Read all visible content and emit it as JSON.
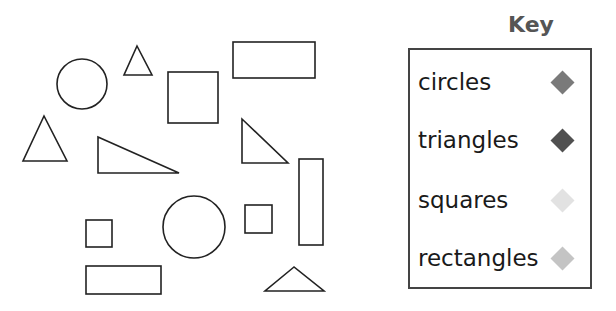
{
  "key": {
    "title": "Key",
    "items": [
      {
        "label": "circles",
        "color": "#7a7a7a"
      },
      {
        "label": "triangles",
        "color": "#505050"
      },
      {
        "label": "squares",
        "color": "#e2e2e2"
      },
      {
        "label": "rectangles",
        "color": "#c4c4c4"
      }
    ]
  },
  "shapes": {
    "stroke": "#222222",
    "circles": [
      {
        "cx": 82,
        "cy": 84,
        "r": 25
      },
      {
        "cx": 194,
        "cy": 227,
        "r": 31
      }
    ],
    "triangles": [
      {
        "points": "137,46 124,75 152,75"
      },
      {
        "points": "44,116 23,161 67,161"
      },
      {
        "points": "98,137 98,173 179,173"
      },
      {
        "points": "242,119 242,163 288,163"
      },
      {
        "points": "294,267 265,291 324,291"
      }
    ],
    "squares": [
      {
        "x": 168,
        "y": 72,
        "w": 50,
        "h": 51
      },
      {
        "x": 86,
        "y": 220,
        "w": 26,
        "h": 27
      },
      {
        "x": 245,
        "y": 205,
        "w": 27,
        "h": 28
      }
    ],
    "rectangles": [
      {
        "x": 233,
        "y": 42,
        "w": 82,
        "h": 36
      },
      {
        "x": 299,
        "y": 159,
        "w": 24,
        "h": 86
      },
      {
        "x": 86,
        "y": 266,
        "w": 75,
        "h": 28
      }
    ]
  }
}
